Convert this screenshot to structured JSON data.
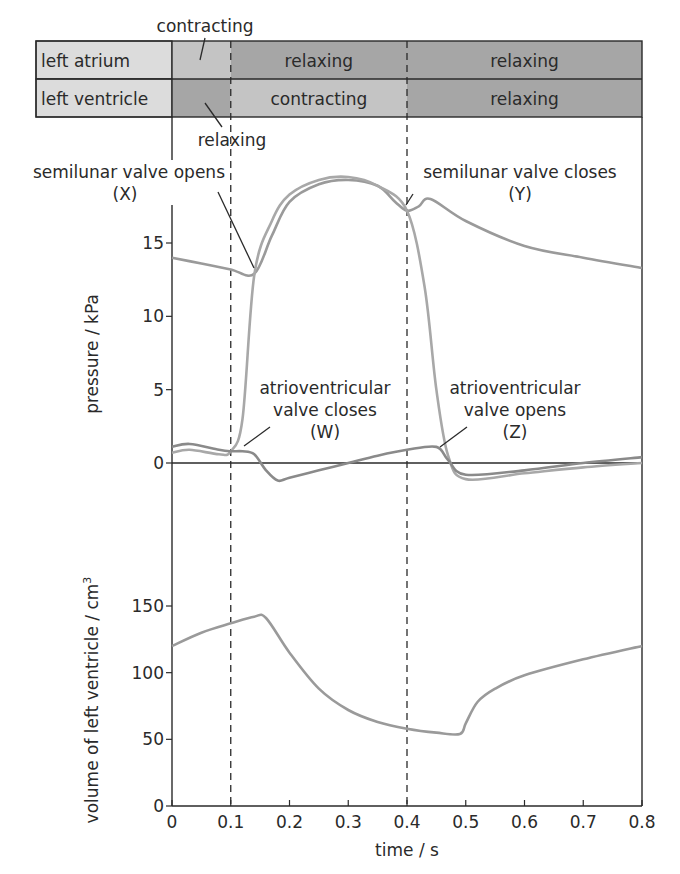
{
  "phase_table": {
    "top_label": "contracting",
    "bottom_label": "relaxing",
    "rows": [
      {
        "name": "left atrium",
        "segments": [
          {
            "label": "",
            "from": 0,
            "to": 0.1,
            "shade": "#c4c4c4"
          },
          {
            "label": "relaxing",
            "from": 0.1,
            "to": 0.4,
            "shade": "#a6a6a6"
          },
          {
            "label": "relaxing",
            "from": 0.4,
            "to": 0.8,
            "shade": "#a6a6a6"
          }
        ]
      },
      {
        "name": "left ventricle",
        "segments": [
          {
            "label": "",
            "from": 0,
            "to": 0.1,
            "shade": "#a6a6a6"
          },
          {
            "label": "contracting",
            "from": 0.1,
            "to": 0.4,
            "shade": "#c4c4c4"
          },
          {
            "label": "relaxing",
            "from": 0.4,
            "to": 0.8,
            "shade": "#a6a6a6"
          }
        ]
      }
    ],
    "label_fill": "#dcdcdc"
  },
  "annotations": {
    "x": [
      "semilunar valve opens",
      "(X)"
    ],
    "y": [
      "semilunar valve closes",
      "(Y)"
    ],
    "w": [
      "atrioventricular",
      "valve closes",
      "(W)"
    ],
    "z": [
      "atrioventricular",
      "valve opens",
      "(Z)"
    ]
  },
  "chart_data": [
    {
      "type": "line",
      "title": "",
      "xlabel": "time / s",
      "ylabel": "pressure / kPa",
      "xlim": [
        0,
        0.8
      ],
      "ylim": [
        -2,
        19
      ],
      "yticks": [
        0,
        5,
        10,
        15
      ],
      "grid": false,
      "vertical_dashed_lines": [
        0.1,
        0.4
      ],
      "series": [
        {
          "name": "aortic pressure",
          "color": "#9a9a9a",
          "x": [
            0,
            0.05,
            0.1,
            0.14,
            0.17,
            0.2,
            0.25,
            0.3,
            0.35,
            0.38,
            0.4,
            0.42,
            0.44,
            0.5,
            0.6,
            0.7,
            0.8
          ],
          "y": [
            14.0,
            13.6,
            13.2,
            12.9,
            15.5,
            17.8,
            19.0,
            19.3,
            18.9,
            17.8,
            17.2,
            17.5,
            18.0,
            16.5,
            14.8,
            14.0,
            13.3
          ]
        },
        {
          "name": "left ventricular pressure",
          "color": "#a8a8a8",
          "x": [
            0,
            0.03,
            0.08,
            0.1,
            0.12,
            0.14,
            0.17,
            0.2,
            0.25,
            0.3,
            0.35,
            0.4,
            0.43,
            0.45,
            0.47,
            0.5,
            0.6,
            0.7,
            0.8
          ],
          "y": [
            0.7,
            0.9,
            0.6,
            0.8,
            3.0,
            12.8,
            16.5,
            18.3,
            19.3,
            19.5,
            18.9,
            17.2,
            12.0,
            5.0,
            0.5,
            -1.1,
            -0.7,
            -0.3,
            0.0
          ]
        },
        {
          "name": "left atrial pressure",
          "color": "#8a8a8a",
          "x": [
            0,
            0.03,
            0.08,
            0.1,
            0.12,
            0.14,
            0.16,
            0.18,
            0.2,
            0.25,
            0.3,
            0.35,
            0.4,
            0.45,
            0.47,
            0.5,
            0.6,
            0.7,
            0.8
          ],
          "y": [
            1.1,
            1.3,
            0.9,
            0.8,
            0.8,
            0.6,
            -0.5,
            -1.2,
            -1.0,
            -0.5,
            0.0,
            0.5,
            0.9,
            1.1,
            0.2,
            -0.8,
            -0.5,
            0.0,
            0.4
          ]
        }
      ]
    },
    {
      "type": "line",
      "title": "",
      "xlabel": "time / s",
      "ylabel": "volume of left ventricle / cm³",
      "xlim": [
        0,
        0.8
      ],
      "ylim": [
        0,
        165
      ],
      "xticks": [
        0,
        0.1,
        0.2,
        0.3,
        0.4,
        0.5,
        0.6,
        0.7,
        0.8
      ],
      "xtick_labels": [
        "0",
        "0.1",
        "0.2",
        "0.3",
        "0.4",
        "0.5",
        "0.6",
        "0.7",
        "0.8"
      ],
      "yticks": [
        0,
        50,
        100,
        150
      ],
      "grid": false,
      "vertical_dashed_lines": [
        0.1,
        0.4
      ],
      "series": [
        {
          "name": "left ventricular volume",
          "color": "#9a9a9a",
          "x": [
            0,
            0.05,
            0.1,
            0.14,
            0.16,
            0.2,
            0.25,
            0.3,
            0.35,
            0.4,
            0.45,
            0.49,
            0.5,
            0.52,
            0.55,
            0.6,
            0.7,
            0.8
          ],
          "y": [
            120,
            130,
            137,
            142,
            141,
            115,
            88,
            72,
            63,
            58,
            55,
            54,
            62,
            78,
            88,
            98,
            110,
            120
          ]
        }
      ]
    }
  ],
  "axis_labels": {
    "pressure": "pressure / kPa",
    "volume": "volume of left ventricle / cm",
    "volume_sup": "3",
    "time": "time / s"
  }
}
